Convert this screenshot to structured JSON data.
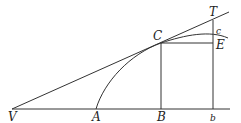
{
  "diagram": {
    "type": "geometric-construction",
    "labels": {
      "V": "V",
      "A": "A",
      "B": "B",
      "b": "b",
      "C": "C",
      "E": "E",
      "T": "T",
      "c": "c"
    },
    "points": {
      "V": [
        12,
        109
      ],
      "A": [
        96,
        109
      ],
      "B": [
        161,
        109
      ],
      "b": [
        213,
        109
      ],
      "C": [
        161,
        43
      ],
      "E": [
        213,
        43
      ],
      "T": [
        213,
        20
      ]
    },
    "elements": [
      {
        "name": "baseline",
        "from": "V",
        "to": "beyond b"
      },
      {
        "name": "tangent-line",
        "from": "V",
        "through": "C",
        "to": "beyond T"
      },
      {
        "name": "curve",
        "from": "A",
        "through": "C",
        "to": "past c"
      },
      {
        "name": "ordinate-CB",
        "from": "C",
        "to": "B"
      },
      {
        "name": "ordinate-Tb",
        "from": "T",
        "to": "b"
      },
      {
        "name": "segment-CE",
        "from": "C",
        "to": "E"
      }
    ],
    "stroke_color": "#333333"
  }
}
